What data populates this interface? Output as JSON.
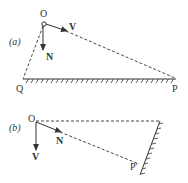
{
  "panel_a": {
    "tag": "(a)",
    "origin_label": "O",
    "velocity_label": "V",
    "normal_label": "N",
    "left_point_label": "Q",
    "right_point_label": "P"
  },
  "panel_b": {
    "tag": "(b)",
    "origin_label": "O",
    "velocity_label": "V",
    "normal_label": "N",
    "point_label": "P′"
  },
  "colors": {
    "ink": "#333333"
  }
}
